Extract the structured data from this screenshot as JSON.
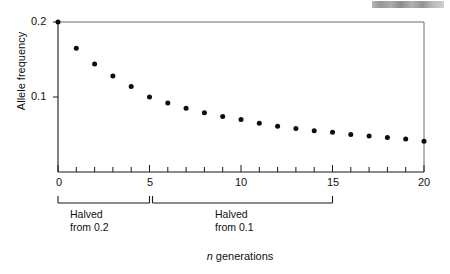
{
  "figure": {
    "background": "#ffffff",
    "ink_color": "#111111",
    "frame_color": "#6e6e6e",
    "header_smudge": {
      "present": true,
      "description": "bold running-head text cropped at top-right edge",
      "text": ""
    }
  },
  "chart_data": {
    "type": "scatter",
    "title": "",
    "xlabel": "n generations",
    "ylabel": "Allele frequency",
    "x": [
      0,
      1,
      2,
      3,
      4,
      5,
      6,
      7,
      8,
      9,
      10,
      11,
      12,
      13,
      14,
      15,
      16,
      17,
      18,
      19,
      20
    ],
    "values": [
      0.2,
      0.165,
      0.144,
      0.128,
      0.114,
      0.1,
      0.092,
      0.085,
      0.079,
      0.074,
      0.07,
      0.065,
      0.061,
      0.058,
      0.055,
      0.053,
      0.05,
      0.048,
      0.046,
      0.044,
      0.041
    ],
    "xlim": [
      0,
      20
    ],
    "ylim": [
      0,
      0.2
    ],
    "xticks": [
      0,
      5,
      10,
      15,
      20
    ],
    "xtick_labels": [
      "0",
      "5",
      "10",
      "15",
      "20"
    ],
    "xminor_tick_step": 1,
    "yticks": [
      0.1,
      0.2
    ],
    "ytick_labels": [
      "0.1",
      "0.2"
    ],
    "grid": false,
    "legend": false,
    "marker": "filled-circle",
    "marker_color": "#0d0d0d",
    "annotations": [
      {
        "name": "halved-from-0.2",
        "x_range": [
          0,
          5
        ],
        "line1": "Halved",
        "line2": "from 0.2"
      },
      {
        "name": "halved-from-0.1",
        "x_range": [
          5,
          15
        ],
        "line1": "Halved",
        "line2": "from 0.1"
      }
    ]
  },
  "axis": {
    "y_label": "Allele frequency",
    "y_ticks": [
      {
        "label": "0.2",
        "value": 0.2
      },
      {
        "label": "0.1",
        "value": 0.1
      }
    ],
    "x_ticks": [
      {
        "label": "0",
        "value": 0
      },
      {
        "label": "5",
        "value": 5
      },
      {
        "label": "10",
        "value": 10
      },
      {
        "label": "15",
        "value": 15
      },
      {
        "label": "20",
        "value": 20
      }
    ],
    "x_title_italic": "n",
    "x_title_rest": " generations"
  },
  "brackets": [
    {
      "label_line1": "Halved",
      "label_line2": "from 0.2"
    },
    {
      "label_line1": "Halved",
      "label_line2": "from 0.1"
    }
  ]
}
